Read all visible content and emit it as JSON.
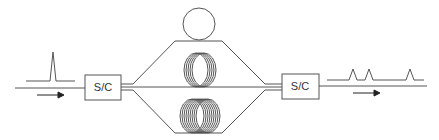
{
  "diagram": {
    "left_block": {
      "label": "S/C"
    },
    "right_block": {
      "label": "S/C"
    },
    "input_pulse_count": 1,
    "output_pulse_count": 3,
    "components": [
      "input-pulse",
      "splitter-combiner",
      "ring-resonator",
      "fiber-coil-short",
      "fiber-coil-long",
      "splitter-combiner",
      "output-pulse-train"
    ],
    "colors": {
      "line": "#555555",
      "arrow": "#222222"
    }
  }
}
